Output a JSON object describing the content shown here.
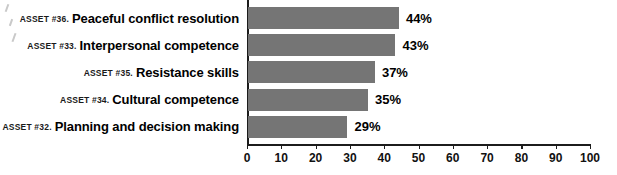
{
  "chart_data": {
    "type": "bar",
    "orientation": "horizontal",
    "title": "",
    "xlabel": "",
    "ylabel": "",
    "xlim": [
      0,
      100
    ],
    "xticks": [
      0,
      10,
      20,
      30,
      40,
      50,
      60,
      70,
      80,
      90,
      100
    ],
    "xtick_labels": [
      "0",
      "10",
      "20",
      "30",
      "40",
      "50",
      "60",
      "70",
      "80",
      "90",
      "100"
    ],
    "grid": false,
    "legend": false,
    "bar_color": "#757575",
    "axis_color": "#1c1c1c",
    "value_suffix": "%",
    "categories": [
      "ASSET #36. Peaceful conflict resolution",
      "ASSET #33. Interpersonal competence",
      "ASSET #35. Resistance skills",
      "ASSET #34. Cultural competence",
      "ASSET #32. Planning and decision making"
    ],
    "values": [
      44,
      43,
      37,
      35,
      29
    ],
    "bars": [
      {
        "asset": "ASSET #36.",
        "label": "Peaceful conflict resolution",
        "value": 44,
        "value_label": "44%"
      },
      {
        "asset": "ASSET #33.",
        "label": "Interpersonal competence",
        "value": 43,
        "value_label": "43%"
      },
      {
        "asset": "ASSET #35.",
        "label": "Resistance skills",
        "value": 37,
        "value_label": "37%"
      },
      {
        "asset": "ASSET #34.",
        "label": "Cultural competence",
        "value": 35,
        "value_label": "35%"
      },
      {
        "asset": "ASSET #32.",
        "label": "Planning and decision making",
        "value": 29,
        "value_label": "29%"
      }
    ]
  }
}
